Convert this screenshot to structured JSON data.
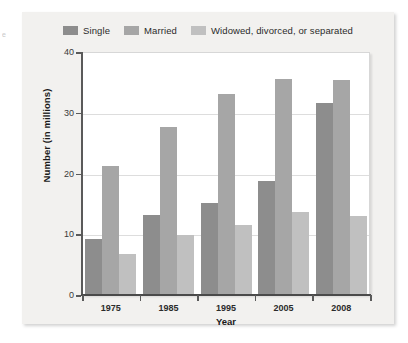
{
  "figure": {
    "margin_fragment_text": "e",
    "background_color": "#f2f1ef",
    "plot_background_color": "#ffffff"
  },
  "chart_data": {
    "type": "bar",
    "title": "",
    "xlabel": "Year",
    "ylabel": "Number (in millions)",
    "categories": [
      "1975",
      "1985",
      "1995",
      "2005",
      "2008"
    ],
    "series": [
      {
        "name": "Single",
        "color": "#8d8d8d",
        "values": [
          9.2,
          13.1,
          15.2,
          18.8,
          31.6
        ]
      },
      {
        "name": "Married",
        "color": "#a6a6a6",
        "values": [
          21.3,
          27.6,
          33.1,
          35.6,
          35.4
        ]
      },
      {
        "name": "Widowed, divorced, or separated",
        "color": "#c0c0c0",
        "values": [
          6.7,
          9.8,
          11.6,
          13.7,
          13.0
        ]
      }
    ],
    "ylim": [
      0,
      40
    ],
    "yticks": [
      0,
      10,
      20,
      30,
      40
    ],
    "ytick_labels": [
      "0",
      "10",
      "20",
      "30",
      "40"
    ],
    "grid": true,
    "grid_axis": "y",
    "grid_color": "#dddddd",
    "legend_position": "top-center",
    "bar_group_order": [
      "Single",
      "Married",
      "Widowed, divorced, or separated"
    ]
  }
}
